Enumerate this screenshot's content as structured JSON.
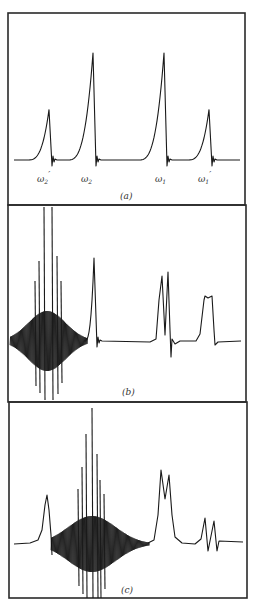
{
  "figure": {
    "panels": [
      {
        "id": "a",
        "caption": "(a)"
      },
      {
        "id": "b",
        "caption": "(b)"
      },
      {
        "id": "c",
        "caption": "(c)"
      }
    ],
    "peak_labels": [
      {
        "base": "ω",
        "sub": "2",
        "prime": "′"
      },
      {
        "base": "ω",
        "sub": "2",
        "prime": ""
      },
      {
        "base": "ω",
        "sub": "1",
        "prime": ""
      },
      {
        "base": "ω",
        "sub": "1",
        "prime": "′"
      }
    ]
  },
  "chart_data": [
    {
      "type": "line",
      "title": "(a)",
      "description": "Spectrum with four asymmetric (dispersion-tailed) peaks",
      "xlabel": "",
      "ylabel": "",
      "grid": false,
      "baseline": 0,
      "peaks": [
        {
          "label": "ω2′",
          "x_px": 49,
          "relative_height": 0.47
        },
        {
          "label": "ω2",
          "x_px": 93,
          "relative_height": 1.0
        },
        {
          "label": "ω1",
          "x_px": 164,
          "relative_height": 1.0
        },
        {
          "label": "ω1′",
          "x_px": 209,
          "relative_height": 0.47
        }
      ]
    },
    {
      "type": "line",
      "title": "(b)",
      "description": "Spectrum with large oscillating burst at left, one peak, a split doublet and a flat-topped peak",
      "xlabel": "",
      "ylabel": "",
      "grid": false,
      "features": [
        {
          "kind": "oscillating-burst",
          "center_x_px": 47,
          "extent_px": [
            10,
            88
          ],
          "clipped": true
        },
        {
          "kind": "peak",
          "x_px": 94,
          "relative_height": 0.85
        },
        {
          "kind": "doublet",
          "x_px": [
            162,
            168
          ],
          "relative_height": [
            0.67,
            0.71
          ]
        },
        {
          "kind": "flat-top-peak",
          "x_px": [
            205,
            212
          ],
          "relative_height": 0.47
        }
      ]
    },
    {
      "type": "line",
      "title": "(c)",
      "description": "Spectrum with a peak, a central oscillating burst, a doublet and a small dispersive doublet",
      "xlabel": "",
      "ylabel": "",
      "grid": false,
      "features": [
        {
          "kind": "peak",
          "x_px": 47,
          "relative_height": 0.36
        },
        {
          "kind": "oscillating-burst",
          "center_x_px": 92,
          "extent_px": [
            51,
            150
          ],
          "clipped": true
        },
        {
          "kind": "doublet",
          "x_px": [
            161,
            169
          ],
          "relative_height": [
            0.54,
            0.5
          ]
        },
        {
          "kind": "small-doublet",
          "x_px": [
            205,
            214
          ],
          "relative_height": [
            0.19,
            0.17
          ]
        }
      ]
    }
  ]
}
